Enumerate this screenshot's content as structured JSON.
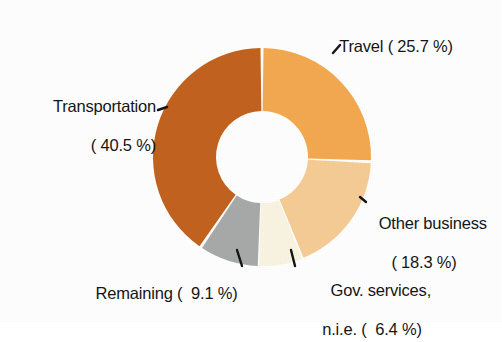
{
  "chart_data": {
    "type": "pie",
    "variant": "donut",
    "title": "",
    "subtitle": "",
    "xlabel": "",
    "ylabel": "",
    "legend_position": "none",
    "grid": false,
    "value_unit": "%",
    "start_angle_deg": 0,
    "direction": "clockwise",
    "center": {
      "x": 262,
      "y": 157
    },
    "outer_radius": 109,
    "inner_radius": 46,
    "background_color": "#FFFFFF",
    "gap_color": "#FFFFFF",
    "categories": [
      "Travel",
      "Other business",
      "Gov. services, n.i.e.",
      "Remaining",
      "Transportation"
    ],
    "values": [
      25.7,
      18.3,
      6.4,
      9.1,
      40.5
    ],
    "colors": [
      "#F4A950",
      "#F6CC95",
      "#FAF5E2",
      "#A8AAA9",
      "#C2621F"
    ],
    "slices": [
      {
        "name": "Travel",
        "value": 25.7,
        "color": "#F4A950"
      },
      {
        "name": "Other business",
        "value": 18.3,
        "color": "#F6CC95"
      },
      {
        "name": "Gov. services, n.i.e.",
        "value": 6.4,
        "color": "#FAF5E2"
      },
      {
        "name": "Remaining",
        "value": 9.1,
        "color": "#A8AAA9"
      },
      {
        "name": "Transportation",
        "value": 40.5,
        "color": "#C2621F"
      }
    ]
  },
  "labels": {
    "travel": {
      "line1": "Travel ( 25.7 %)"
    },
    "transportation": {
      "line1": "Transportation",
      "line2": "( 40.5 %)"
    },
    "other_business": {
      "line1": "Other business",
      "line2": "( 18.3 %)"
    },
    "remaining": {
      "line1": "Remaining (  9.1 %)"
    },
    "gov_services": {
      "line1": "Gov. services,",
      "line2": "n.i.e. (  6.4 %)"
    }
  }
}
